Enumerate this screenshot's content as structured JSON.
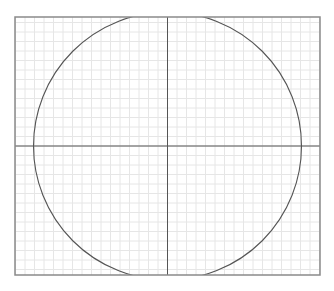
{
  "diagram": {
    "type": "circle-on-grid",
    "frame": {
      "x": 15,
      "y": 17,
      "width": 305,
      "height": 258,
      "stroke": "#8a8a8a"
    },
    "grid": {
      "spacing": 9.5,
      "color": "#e6e6e6"
    },
    "axes": {
      "cx": 167.5,
      "cy": 146,
      "color": "#555555"
    },
    "circle": {
      "cx": 167.5,
      "cy": 146,
      "r": 134,
      "stroke": "#555555",
      "clipped_to_frame": true
    }
  }
}
